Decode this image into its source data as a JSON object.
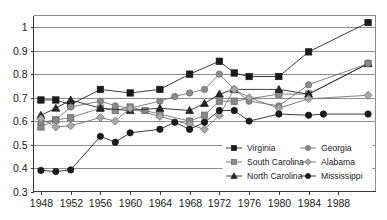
{
  "chart_data": {
    "type": "line",
    "title": "",
    "xlabel": "",
    "ylabel": "",
    "xlim": [
      1947,
      1993
    ],
    "ylim": [
      0.3,
      1.05
    ],
    "grid": true,
    "legend_position": "inside-bottom-right",
    "x": [
      1948,
      1950,
      1952,
      1954,
      1956,
      1958,
      1960,
      1962,
      1964,
      1966,
      1968,
      1970,
      1972,
      1974,
      1976,
      1980,
      1984,
      1986,
      1992
    ],
    "xticks": [
      "1948",
      "1952",
      "1956",
      "1960",
      "1964",
      "1968",
      "1972",
      "1976",
      "1980",
      "1984",
      "1988"
    ],
    "xtick_values": [
      1948,
      1952,
      1956,
      1960,
      1964,
      1968,
      1972,
      1976,
      1980,
      1984,
      1988
    ],
    "yticks": [
      "0.3",
      "0.4",
      "0.5",
      "0.6",
      "0.7",
      "0.8",
      "0.9",
      "1"
    ],
    "ytick_values": [
      0.3,
      0.4,
      0.5,
      0.6,
      0.7,
      0.8,
      0.9,
      1.0
    ],
    "series": [
      {
        "name": "Virginia",
        "marker": "square",
        "color": "#1a1a1a",
        "fill": "#1a1a1a",
        "x": [
          1948,
          1950,
          1952,
          1956,
          1960,
          1964,
          1968,
          1972,
          1974,
          1976,
          1980,
          1984,
          1992
        ],
        "values": [
          0.69,
          0.69,
          0.67,
          0.735,
          0.72,
          0.735,
          0.8,
          0.855,
          0.805,
          0.79,
          0.79,
          0.895,
          1.02
        ]
      },
      {
        "name": "South Carolina",
        "marker": "square",
        "color": "#6b6b6b",
        "fill": "#8a8a8a",
        "x": [
          1948,
          1950,
          1952,
          1956,
          1958,
          1960,
          1962,
          1964,
          1968,
          1970,
          1972,
          1974,
          1980,
          1984,
          1992
        ],
        "values": [
          0.575,
          0.605,
          0.615,
          0.655,
          0.645,
          0.66,
          0.645,
          0.63,
          0.6,
          0.625,
          0.685,
          0.685,
          0.715,
          0.715,
          0.845
        ]
      },
      {
        "name": "North Carolina",
        "marker": "triangle",
        "color": "#1a1a1a",
        "fill": "#262626",
        "x": [
          1948,
          1950,
          1952,
          1956,
          1960,
          1964,
          1968,
          1970,
          1972,
          1974,
          1980,
          1984,
          1992
        ],
        "values": [
          0.625,
          0.655,
          0.69,
          0.655,
          0.645,
          0.655,
          0.645,
          0.675,
          0.715,
          0.735,
          0.735,
          0.715,
          0.845
        ]
      },
      {
        "name": "Georgia",
        "marker": "circle",
        "color": "#6b6b6b",
        "fill": "#8a8a8a",
        "x": [
          1948,
          1950,
          1952,
          1956,
          1958,
          1960,
          1964,
          1966,
          1968,
          1970,
          1972,
          1974,
          1976,
          1980,
          1984,
          1992
        ],
        "values": [
          0.595,
          0.605,
          0.66,
          0.685,
          0.665,
          0.655,
          0.685,
          0.705,
          0.72,
          0.735,
          0.8,
          0.735,
          0.685,
          0.665,
          0.755,
          0.845
        ]
      },
      {
        "name": "Alabama",
        "marker": "diamond",
        "color": "#6b6b6b",
        "fill": "#a8a8a8",
        "x": [
          1948,
          1950,
          1952,
          1956,
          1958,
          1960,
          1964,
          1968,
          1970,
          1972,
          1974,
          1976,
          1980,
          1984,
          1992
        ],
        "values": [
          0.61,
          0.575,
          0.58,
          0.615,
          0.6,
          0.655,
          0.62,
          0.585,
          0.565,
          0.625,
          0.735,
          0.7,
          0.655,
          0.695,
          0.71
        ]
      },
      {
        "name": "Mississippi",
        "marker": "circle",
        "color": "#1a1a1a",
        "fill": "#1a1a1a",
        "x": [
          1948,
          1950,
          1952,
          1956,
          1958,
          1960,
          1964,
          1966,
          1968,
          1970,
          1972,
          1974,
          1976,
          1980,
          1984,
          1986,
          1992
        ],
        "values": [
          0.39,
          0.385,
          0.392,
          0.535,
          0.51,
          0.55,
          0.565,
          0.595,
          0.565,
          0.595,
          0.645,
          0.645,
          0.6,
          0.63,
          0.625,
          0.63,
          0.63
        ]
      }
    ]
  },
  "legend": {
    "entries": [
      {
        "label": "Virginia"
      },
      {
        "label": "Georgia"
      },
      {
        "label": "South Carolina"
      },
      {
        "label": "Alabama"
      },
      {
        "label": "North Carolina"
      },
      {
        "label": "Mississippi"
      }
    ]
  },
  "colors": {
    "grid": "#8c8c8c",
    "axis": "#3a3a3a",
    "dark_marker": "#1a1a1a",
    "gray_marker": "#8a8a8a",
    "background": "#ffffff"
  }
}
